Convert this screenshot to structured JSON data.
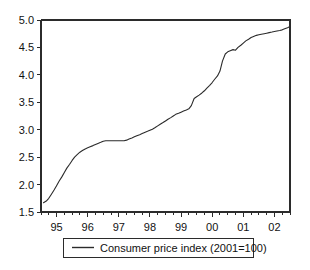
{
  "chart_data": {
    "type": "line",
    "title": "",
    "subtitle": "",
    "xlabel": "",
    "ylabel": "",
    "xlim": [
      1994.5,
      2002.5
    ],
    "ylim": [
      1.5,
      5.0
    ],
    "grid": false,
    "legend_position": "below-axes",
    "y_ticks": [
      "1.5",
      "2.0",
      "2.5",
      "3.0",
      "3.5",
      "4.0",
      "4.5",
      "5.0"
    ],
    "y_tick_values": [
      1.5,
      2.0,
      2.5,
      3.0,
      3.5,
      4.0,
      4.5,
      5.0
    ],
    "x_ticks": [
      "95",
      "96",
      "97",
      "98",
      "99",
      "00",
      "01",
      "02"
    ],
    "x_tick_values": [
      1995,
      1996,
      1997,
      1998,
      1999,
      2000,
      2001,
      2002
    ],
    "x_minor_per_major": 4,
    "series": [
      {
        "name": "Consumer price index  (2001=100)",
        "color": "#2b2b2b",
        "x": [
          1994.58,
          1994.67,
          1994.75,
          1994.83,
          1994.92,
          1995.0,
          1995.08,
          1995.17,
          1995.25,
          1995.33,
          1995.42,
          1995.5,
          1995.58,
          1995.67,
          1995.75,
          1995.83,
          1995.92,
          1996.0,
          1996.08,
          1996.17,
          1996.25,
          1996.33,
          1996.42,
          1996.5,
          1996.58,
          1996.67,
          1996.75,
          1996.83,
          1996.92,
          1997.0,
          1997.08,
          1997.17,
          1997.25,
          1997.33,
          1997.42,
          1997.5,
          1997.58,
          1997.67,
          1997.75,
          1997.83,
          1997.92,
          1998.0,
          1998.08,
          1998.17,
          1998.25,
          1998.33,
          1998.42,
          1998.5,
          1998.58,
          1998.67,
          1998.75,
          1998.83,
          1998.92,
          1999.0,
          1999.08,
          1999.17,
          1999.25,
          1999.33,
          1999.42,
          1999.5,
          1999.58,
          1999.67,
          1999.75,
          1999.83,
          1999.92,
          2000.0,
          2000.08,
          2000.17,
          2000.25,
          2000.33,
          2000.42,
          2000.5,
          2000.58,
          2000.67,
          2000.75,
          2000.83,
          2000.92,
          2001.0,
          2001.08,
          2001.17,
          2001.25,
          2001.33,
          2001.42,
          2001.5,
          2001.58,
          2001.67,
          2001.75,
          2001.83,
          2001.92,
          2002.0,
          2002.08,
          2002.17,
          2002.25,
          2002.33,
          2002.42,
          2002.5
        ],
        "values": [
          1.67,
          1.7,
          1.75,
          1.82,
          1.9,
          1.98,
          2.06,
          2.14,
          2.22,
          2.3,
          2.37,
          2.44,
          2.5,
          2.55,
          2.59,
          2.62,
          2.65,
          2.67,
          2.69,
          2.71,
          2.73,
          2.75,
          2.77,
          2.79,
          2.8,
          2.8,
          2.8,
          2.8,
          2.8,
          2.8,
          2.8,
          2.8,
          2.81,
          2.83,
          2.85,
          2.87,
          2.89,
          2.91,
          2.93,
          2.95,
          2.97,
          2.99,
          3.01,
          3.04,
          3.07,
          3.1,
          3.13,
          3.16,
          3.19,
          3.22,
          3.25,
          3.28,
          3.3,
          3.32,
          3.34,
          3.36,
          3.38,
          3.44,
          3.57,
          3.6,
          3.63,
          3.67,
          3.71,
          3.76,
          3.81,
          3.86,
          3.92,
          3.98,
          4.07,
          4.25,
          4.38,
          4.42,
          4.44,
          4.46,
          4.45,
          4.5,
          4.54,
          4.58,
          4.62,
          4.65,
          4.68,
          4.7,
          4.72,
          4.73,
          4.74,
          4.75,
          4.76,
          4.77,
          4.78,
          4.79,
          4.8,
          4.81,
          4.82,
          4.84,
          4.86,
          4.88
        ]
      }
    ]
  },
  "legend": {
    "entries": [
      {
        "label": "Consumer price index  (2001=100)"
      }
    ]
  }
}
